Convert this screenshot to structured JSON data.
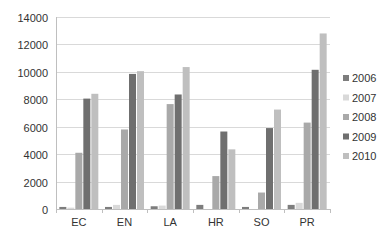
{
  "chart_data": {
    "type": "bar",
    "title": "",
    "xlabel": "",
    "ylabel": "",
    "ylim": [
      0,
      14000
    ],
    "yticks": [
      0,
      2000,
      4000,
      6000,
      8000,
      10000,
      12000,
      14000
    ],
    "grid": true,
    "legend_position": "right",
    "categories": [
      "EC",
      "EN",
      "LA",
      "HR",
      "SO",
      "PR"
    ],
    "series": [
      {
        "name": "2006",
        "color": "#7d7d7d",
        "values": [
          150,
          150,
          200,
          300,
          150,
          300
        ]
      },
      {
        "name": "2007",
        "color": "#d9d9d9",
        "values": [
          100,
          300,
          250,
          0,
          0,
          450
        ]
      },
      {
        "name": "2008",
        "color": "#a9a9a9",
        "values": [
          4100,
          5800,
          7650,
          2400,
          1200,
          6300
        ]
      },
      {
        "name": "2009",
        "color": "#6f6f6f",
        "values": [
          8050,
          9850,
          8350,
          5650,
          5900,
          10150
        ]
      },
      {
        "name": "2010",
        "color": "#bfbfbf",
        "values": [
          8400,
          10050,
          10350,
          4350,
          7250,
          12800
        ]
      }
    ]
  }
}
